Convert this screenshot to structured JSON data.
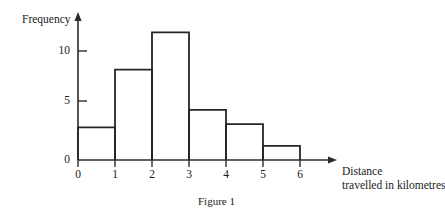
{
  "figure": {
    "caption": "Figure 1",
    "y_axis_label": "Frequency",
    "x_axis_label_line1": "Distance",
    "x_axis_label_line2": "travelled in kilometres",
    "axis_color": "#2b2b2b",
    "bar_outline_color": "#262626",
    "background": "#ffffff"
  },
  "chart_data": {
    "type": "bar",
    "title": "Figure 1",
    "xlabel": "Distance travelled in kilometres",
    "ylabel": "Frequency",
    "categories": [
      "0-1",
      "1-2",
      "2-3",
      "3-4",
      "4-5",
      "5-6"
    ],
    "bin_edges": [
      0,
      1,
      2,
      3,
      4,
      5,
      6
    ],
    "values": [
      3,
      8.3,
      11.7,
      4.6,
      3.3,
      1.3
    ],
    "xtick_labels": [
      "0",
      "1",
      "2",
      "3",
      "4",
      "5",
      "6"
    ],
    "xtick_values": [
      0,
      1,
      2,
      3,
      4,
      5,
      6
    ],
    "ytick_labels": [
      "0",
      "5",
      "10"
    ],
    "ytick_values": [
      0,
      5,
      10
    ],
    "xlim": [
      0,
      6
    ],
    "ylim": [
      0,
      12.5
    ],
    "grid": false,
    "legend": false,
    "bars_filled": false
  }
}
